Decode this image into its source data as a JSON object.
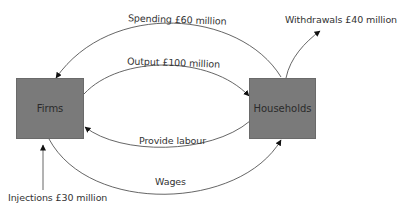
{
  "diagram": {
    "type": "circular-flow-of-income",
    "nodes": {
      "firms": {
        "label": "Firms"
      },
      "households": {
        "label": "Households"
      }
    },
    "flows": {
      "spending": {
        "label": "Spending £60 million",
        "from": "households",
        "to": "firms"
      },
      "output": {
        "label": "Output £100 million",
        "from": "firms",
        "to": "households"
      },
      "labour": {
        "label": "Provide labour",
        "from": "households",
        "to": "firms"
      },
      "wages": {
        "label": "Wages",
        "from": "firms",
        "to": "households"
      },
      "withdrawals": {
        "label": "Withdrawals £40 million",
        "from": "households",
        "to": "outside"
      },
      "injections": {
        "label": "Injections £30 million",
        "from": "outside",
        "to": "firms"
      }
    },
    "colors": {
      "box_fill": "#7a7a7a",
      "line": "#555555",
      "text": "#333333"
    }
  }
}
